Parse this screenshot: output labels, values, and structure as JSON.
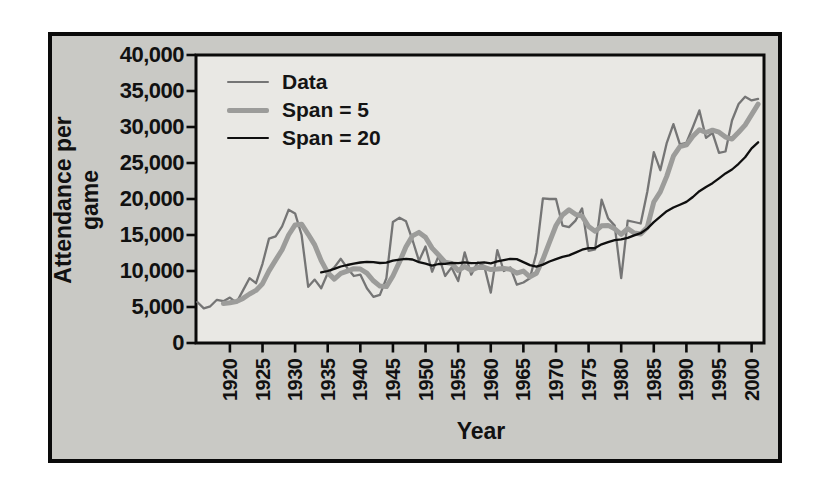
{
  "figure": {
    "background": "#c9c9c5",
    "plot_background": "#e9e8e4",
    "frame_color": "#0a0a0a"
  },
  "chart_data": {
    "type": "line",
    "title": "",
    "xlabel": "Year",
    "ylabel": "Attendance per game",
    "x_domain": [
      1914.8,
      2001.9
    ],
    "ylim": [
      0,
      40000
    ],
    "grid": false,
    "legend_position": "upper-left-inside",
    "x_ticks": [
      1920,
      1925,
      1930,
      1935,
      1940,
      1945,
      1950,
      1955,
      1960,
      1965,
      1970,
      1975,
      1980,
      1985,
      1990,
      1995,
      2000
    ],
    "x_tick_labels": [
      "1920",
      "1925",
      "1930",
      "1935",
      "1940",
      "1945",
      "1950",
      "1955",
      "1960",
      "1965",
      "1970",
      "1975",
      "1980",
      "1985",
      "1990",
      "1995",
      "2000"
    ],
    "y_ticks": [
      0,
      5000,
      10000,
      15000,
      20000,
      25000,
      30000,
      35000,
      40000
    ],
    "y_tick_labels": [
      "0",
      "5,000",
      "10,000",
      "15,000",
      "20,000",
      "25,000",
      "30,000",
      "35,000",
      "40,000"
    ],
    "years": [
      1915,
      1916,
      1917,
      1918,
      1919,
      1920,
      1921,
      1922,
      1923,
      1924,
      1925,
      1926,
      1927,
      1928,
      1929,
      1930,
      1931,
      1932,
      1933,
      1934,
      1935,
      1936,
      1937,
      1938,
      1939,
      1940,
      1941,
      1942,
      1943,
      1944,
      1945,
      1946,
      1947,
      1948,
      1949,
      1950,
      1951,
      1952,
      1953,
      1954,
      1955,
      1956,
      1957,
      1958,
      1959,
      1960,
      1961,
      1962,
      1963,
      1964,
      1965,
      1966,
      1967,
      1968,
      1969,
      1970,
      1971,
      1972,
      1973,
      1974,
      1975,
      1976,
      1977,
      1978,
      1979,
      1980,
      1981,
      1982,
      1983,
      1984,
      1985,
      1986,
      1987,
      1988,
      1989,
      1990,
      1991,
      1992,
      1993,
      1994,
      1995,
      1996,
      1997,
      1998,
      1999,
      2000,
      2001
    ],
    "series": [
      {
        "name": "Data",
        "color": "#757575",
        "stroke_width": 2.3,
        "values": [
          5700,
          4800,
          5100,
          6000,
          5800,
          6300,
          5600,
          7300,
          9000,
          8300,
          11000,
          14500,
          14800,
          16200,
          18500,
          18000,
          15000,
          7800,
          8800,
          7600,
          9700,
          10500,
          11700,
          10400,
          9300,
          9500,
          7600,
          6400,
          6700,
          9000,
          16800,
          17400,
          16900,
          14300,
          11400,
          13400,
          9900,
          12100,
          9300,
          10500,
          8600,
          12600,
          9500,
          11200,
          10700,
          7000,
          12900,
          10000,
          10500,
          8100,
          8400,
          9000,
          12500,
          20100,
          20000,
          20000,
          16300,
          16100,
          17000,
          18700,
          12800,
          13000,
          19900,
          17300,
          16300,
          9000,
          17000,
          16800,
          16600,
          21000,
          26500,
          24000,
          27800,
          30400,
          27600,
          27800,
          30000,
          32300,
          28500,
          29200,
          26400,
          26600,
          30900,
          33200,
          34200,
          33700,
          33900
        ]
      },
      {
        "name": "Span = 5",
        "color": "#9c9c9a",
        "stroke_width": 5,
        "derived": {
          "method": "trailing_moving_average",
          "span": 5,
          "source": "Data"
        }
      },
      {
        "name": "Span = 20",
        "color": "#0f0f0f",
        "stroke_width": 2.3,
        "derived": {
          "method": "trailing_moving_average",
          "span": 20,
          "source": "Data"
        }
      }
    ]
  }
}
